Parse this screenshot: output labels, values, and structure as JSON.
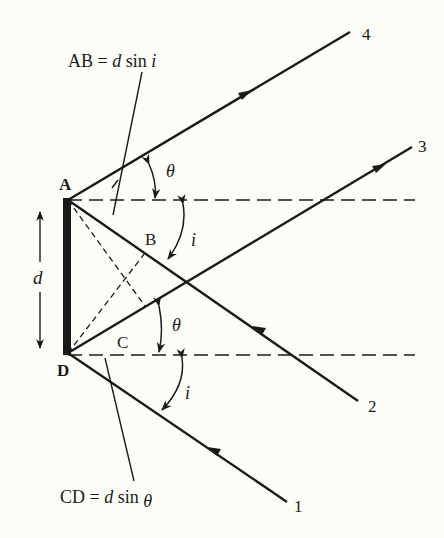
{
  "diagram": {
    "colors": {
      "background": "#fdfdf8",
      "ink": "#1a1a1a"
    },
    "points": {
      "A": "A",
      "B": "B",
      "C": "C",
      "D": "D"
    },
    "rays": [
      {
        "id": "1",
        "label": "1",
        "direction": "incoming"
      },
      {
        "id": "2",
        "label": "2",
        "direction": "incoming"
      },
      {
        "id": "3",
        "label": "3",
        "direction": "outgoing"
      },
      {
        "id": "4",
        "label": "4",
        "direction": "outgoing"
      }
    ],
    "angles": {
      "theta_top": "θ",
      "i_top": "i",
      "theta_bottom": "θ",
      "i_bottom": "i"
    },
    "dimension": {
      "label": "d"
    },
    "equations": {
      "top": {
        "lhs": "AB = ",
        "var": "d",
        "rhs": " sin ",
        "angle": "i"
      },
      "bottom": {
        "lhs": "CD = ",
        "var": "d",
        "rhs": " sin ",
        "angle": "θ"
      }
    }
  }
}
